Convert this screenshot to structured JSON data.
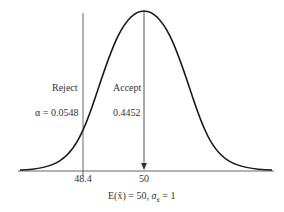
{
  "diagram": {
    "type": "normal-distribution-hypothesis-test",
    "labels": {
      "reject": "Reject",
      "accept": "Accept",
      "alpha": "α = 0.0548",
      "accept_prob": "0.4452"
    },
    "ticks": {
      "critical": "48.4",
      "mean": "50"
    },
    "caption": {
      "expectation": "E(x̄) = 50,",
      "sigma_symbol": "σ",
      "sigma_sub": "x̄",
      "sigma_value": "= 1"
    },
    "colors": {
      "curve": "#1a1a1a",
      "lines": "#555555"
    }
  }
}
